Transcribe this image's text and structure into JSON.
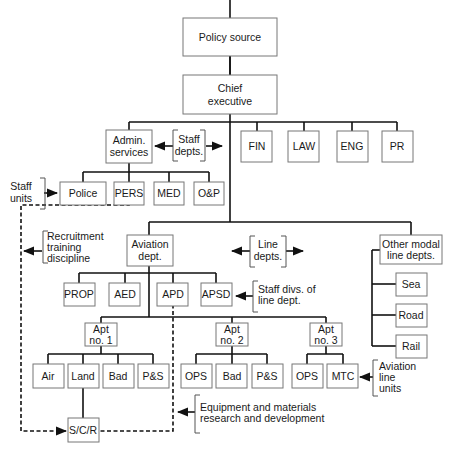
{
  "diagram": {
    "boxes": {
      "policy_source": "Policy source",
      "chief_l1": "Chief",
      "chief_l2": "executive",
      "admin_l1": "Admin.",
      "admin_l2": "services",
      "fin": "FIN",
      "law": "LAW",
      "eng": "ENG",
      "pr": "PR",
      "police": "Police",
      "pers": "PERS",
      "med": "MED",
      "op": "O&P",
      "aviation_l1": "Aviation",
      "aviation_l2": "dept.",
      "other_l1": "Other modal",
      "other_l2": "line depts.",
      "sea": "Sea",
      "road": "Road",
      "rail": "Rail",
      "prop": "PROP",
      "aed": "AED",
      "apd": "APD",
      "apsd": "APSD",
      "apt1_l1": "Apt",
      "apt1_l2": "no. 1",
      "apt2_l1": "Apt",
      "apt2_l2": "no. 2",
      "apt3_l1": "Apt",
      "apt3_l2": "no. 3",
      "air": "Air",
      "land": "Land",
      "bad1": "Bad",
      "ps1": "P&S",
      "ops2": "OPS",
      "bad2": "Bad",
      "ps2": "P&S",
      "ops3": "OPS",
      "mtc": "MTC",
      "scr": "S/C/R"
    },
    "annotations": {
      "staff_depts_l1": "Staff",
      "staff_depts_l2": "depts.",
      "staff_units_l1": "Staff",
      "staff_units_l2": "units",
      "recruit_l1": "Recruitment",
      "recruit_l2": "training",
      "recruit_l3": "discipline",
      "line_depts_l1": "Line",
      "line_depts_l2": "depts.",
      "staff_divs_l1": "Staff divs. of",
      "staff_divs_l2": "line dept.",
      "aviation_units_l1": "Aviation",
      "aviation_units_l2": "line",
      "aviation_units_l3": "units",
      "equip_l1": "Equipment and materials",
      "equip_l2": "research and development"
    }
  }
}
